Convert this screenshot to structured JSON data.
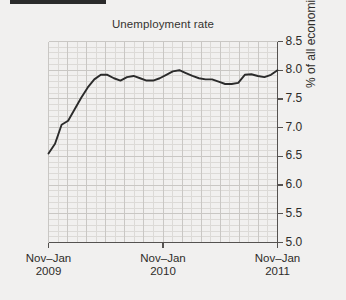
{
  "figure": {
    "background_color": "#f1f0ef",
    "rule_color": "#2b2b2b",
    "line_color": "#2b2b2b",
    "grid_color": "#c9c7c4",
    "minor_grid_color": "#dcdad7",
    "axis_color": "#555250",
    "text_color": "#2e2c29"
  },
  "chart_data": {
    "type": "line",
    "title": "Unemployment rate",
    "xlabel": "",
    "ylabel": "% of all economically active",
    "ylim": [
      5.0,
      8.5
    ],
    "ytick_labels": [
      "8.5",
      "8.0",
      "7.5",
      "7.0",
      "6.5",
      "6.0",
      "5.5",
      "5.0"
    ],
    "ytick_values": [
      8.5,
      8.0,
      7.5,
      7.0,
      6.5,
      6.0,
      5.5,
      5.0
    ],
    "xtick_labels": [
      {
        "line1": "Nov–Jan",
        "line2": "2009"
      },
      {
        "line1": "Nov–Jan",
        "line2": "2010"
      },
      {
        "line1": "Nov–Jan",
        "line2": "2011"
      }
    ],
    "grid": true,
    "minor_grid": true,
    "legend": "none",
    "yaxis_position": "right",
    "series": [
      {
        "name": "Unemployment rate",
        "values": [
          6.55,
          6.72,
          7.05,
          7.12,
          7.32,
          7.52,
          7.7,
          7.84,
          7.92,
          7.92,
          7.86,
          7.82,
          7.88,
          7.9,
          7.86,
          7.82,
          7.82,
          7.86,
          7.92,
          7.98,
          8.0,
          7.95,
          7.9,
          7.86,
          7.84,
          7.84,
          7.8,
          7.76,
          7.76,
          7.78,
          7.92,
          7.93,
          7.9,
          7.88,
          7.92,
          8.0
        ]
      }
    ],
    "x_index_range": [
      0,
      35
    ]
  }
}
